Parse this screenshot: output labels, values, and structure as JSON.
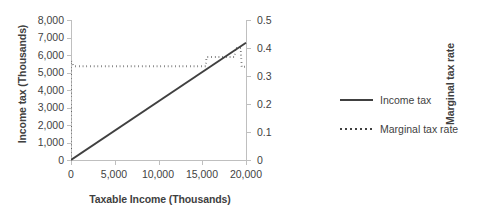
{
  "chart_data": {
    "type": "line",
    "title": "",
    "xlabel": "Taxable Income (Thousands)",
    "ylabel": "Income tax (Thousands)",
    "y2label": "Marginal tax rate",
    "xlim": [
      0,
      20000
    ],
    "ylim": [
      0,
      8000
    ],
    "y2lim": [
      0,
      0.5
    ],
    "grid": false,
    "legend_position": "right",
    "xticks": [
      "0",
      "5,000",
      "10,000",
      "15,000",
      "20,000"
    ],
    "xtick_values": [
      0,
      5000,
      10000,
      15000,
      20000
    ],
    "yticks": [
      "0",
      "1,000",
      "2,000",
      "3,000",
      "4,000",
      "5,000",
      "6,000",
      "7,000",
      "8,000"
    ],
    "ytick_values": [
      0,
      1000,
      2000,
      3000,
      4000,
      5000,
      6000,
      7000,
      8000
    ],
    "y2ticks": [
      "0",
      "0.1",
      "0.2",
      "0.3",
      "0.4",
      "0.5"
    ],
    "y2tick_values": [
      0,
      0.1,
      0.2,
      0.3,
      0.4,
      0.5
    ],
    "series": [
      {
        "name": "Income tax",
        "axis": "left",
        "style": "solid",
        "color": "#404040",
        "x": [
          0,
          20000
        ],
        "values": [
          0,
          6700
        ]
      },
      {
        "name": "Marginal tax rate",
        "axis": "right",
        "style": "dotted",
        "color": "#404040",
        "x": [
          0,
          0,
          300,
          1200,
          9000,
          15400,
          15500,
          18700,
          18800,
          19400,
          19500,
          20000
        ],
        "values": [
          0.0,
          0.355,
          0.335,
          0.335,
          0.335,
          0.335,
          0.368,
          0.368,
          0.4,
          0.4,
          0.333,
          0.333
        ]
      }
    ]
  },
  "legend": {
    "entries": [
      {
        "label": "Income tax",
        "style": "solid"
      },
      {
        "label": "Marginal tax rate",
        "style": "dotted"
      }
    ]
  }
}
